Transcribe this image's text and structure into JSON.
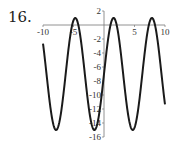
{
  "problem_number": "16.",
  "chart_data": {
    "type": "line",
    "title": "",
    "xlabel": "",
    "ylabel": "",
    "function": "y = 8 sin(x) - 7",
    "xlim": [
      -10,
      10
    ],
    "ylim": [
      -16,
      2
    ],
    "grid": false,
    "x_ticks": [
      -10,
      -5,
      5,
      10
    ],
    "x_tick_labels": [
      "-10",
      "-5",
      "5",
      "10"
    ],
    "y_ticks": [
      2,
      -2,
      -4,
      -6,
      -8,
      -10,
      -12,
      -14,
      -16
    ],
    "y_tick_labels": [
      "2",
      "-2",
      "-4",
      "-6",
      "-8",
      "-10",
      "-12",
      "-14",
      "-16"
    ],
    "series": [
      {
        "name": "f(x)",
        "color": "#1a1a1a",
        "x": [
          -10,
          -8,
          -7.85,
          -6,
          -4.71,
          -3,
          -1.57,
          0,
          1.57,
          3,
          4.71,
          6,
          7.85,
          9,
          10
        ],
        "values": [
          -2.65,
          -14.9,
          -15,
          -4.8,
          1,
          -5.9,
          -15,
          -7,
          1,
          -5.9,
          -15,
          -9.2,
          1,
          -3.7,
          -11.35
        ]
      }
    ]
  }
}
